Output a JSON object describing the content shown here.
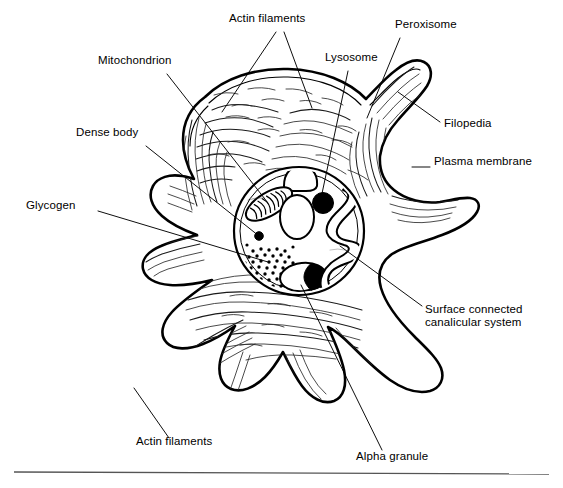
{
  "figure": {
    "background_color": "#ffffff",
    "ink_color": "#000000",
    "width": 563,
    "height": 488,
    "has_bottom_rule": true,
    "bottom_rule_color": "#555555"
  },
  "labels": {
    "actin_filaments_top": "Actin filaments",
    "peroxisome": "Peroxisome",
    "mitochondrion": "Mitochondrion",
    "lysosome": "Lysosome",
    "filopedia": "Filopedia",
    "dense_body": "Dense body",
    "plasma_membrane": "Plasma membrane",
    "glycogen": "Glycogen",
    "surface_connected_canalicular_system": "Surface connected\ncanalicular system",
    "actin_filaments_bottom": "Actin filaments",
    "alpha_granule": "Alpha granule"
  },
  "annotations": [
    {
      "id": "actin-filaments-top",
      "label": "Actin filaments",
      "text_x": 229,
      "text_y": 18,
      "lines": 1,
      "leaders": [
        {
          "x1": 276,
          "y1": 32,
          "x2": 222,
          "y2": 112
        },
        {
          "x1": 284,
          "y1": 32,
          "x2": 312,
          "y2": 108
        }
      ]
    },
    {
      "id": "peroxisome",
      "label": "Peroxisome",
      "text_x": 395,
      "text_y": 24,
      "lines": 1,
      "leaders": [
        {
          "x1": 400,
          "y1": 38,
          "x2": 367,
          "y2": 118
        }
      ]
    },
    {
      "id": "mitochondrion",
      "label": "Mitochondrion",
      "text_x": 98,
      "text_y": 60,
      "lines": 1,
      "leaders": [
        {
          "x1": 167,
          "y1": 74,
          "x2": 268,
          "y2": 203
        }
      ]
    },
    {
      "id": "lysosome",
      "label": "Lysosome",
      "text_x": 325,
      "text_y": 57,
      "lines": 1,
      "leaders": [
        {
          "x1": 348,
          "y1": 71,
          "x2": 320,
          "y2": 203
        }
      ]
    },
    {
      "id": "filopedia",
      "label": "Filopedia",
      "text_x": 444,
      "text_y": 122,
      "lines": 1,
      "leaders": [
        {
          "x1": 440,
          "y1": 122,
          "x2": 398,
          "y2": 92
        }
      ]
    },
    {
      "id": "dense-body",
      "label": "Dense body",
      "text_x": 76,
      "text_y": 132,
      "lines": 1,
      "leaders": [
        {
          "x1": 146,
          "y1": 146,
          "x2": 259,
          "y2": 236
        }
      ]
    },
    {
      "id": "plasma-membrane",
      "label": "Plasma membrane",
      "text_x": 434,
      "text_y": 161,
      "lines": 1,
      "leaders": [
        {
          "x1": 430,
          "y1": 167,
          "x2": 412,
          "y2": 167
        }
      ]
    },
    {
      "id": "glycogen",
      "label": "Glycogen",
      "text_x": 26,
      "text_y": 205,
      "lines": 1,
      "leaders": [
        {
          "x1": 98,
          "y1": 211,
          "x2": 268,
          "y2": 262
        }
      ]
    },
    {
      "id": "surface-connected-canalicular-system",
      "label": "Surface connected\ncanalicular system",
      "text_x": 425,
      "text_y": 308,
      "lines": 2,
      "leaders": [
        {
          "x1": 422,
          "y1": 306,
          "x2": 340,
          "y2": 246
        }
      ]
    },
    {
      "id": "actin-filaments-bottom",
      "label": "Actin filaments",
      "text_x": 136,
      "text_y": 441,
      "lines": 1,
      "leaders": [
        {
          "x1": 169,
          "y1": 438,
          "x2": 134,
          "y2": 388
        }
      ]
    },
    {
      "id": "alpha-granule",
      "label": "Alpha granule",
      "text_x": 356,
      "text_y": 456,
      "lines": 1,
      "leaders": [
        {
          "x1": 382,
          "y1": 450,
          "x2": 301,
          "y2": 285
        }
      ]
    }
  ],
  "structures": {
    "plasma_membrane": {
      "name": "plasma-membrane",
      "stroke_width": 2.6
    },
    "granulomere": {
      "name": "granulomere-boundary",
      "cx": 299,
      "cy": 231,
      "rx": 65,
      "ry": 64
    },
    "mitochondrion": {
      "name": "mitochondrion",
      "cx": 269,
      "cy": 204,
      "cristae_count": 9
    },
    "lysosome": {
      "name": "lysosome",
      "cx": 322,
      "cy": 204,
      "r": 10.5,
      "fill": "#000000"
    },
    "peroxisome": {
      "name": "peroxisome",
      "cx": 297,
      "cy": 178,
      "shape": "dome"
    },
    "dense_body": {
      "name": "dense-body",
      "cx": 259,
      "cy": 236,
      "r": 4.2,
      "fill": "#000000"
    },
    "glycogen": {
      "name": "glycogen-granules",
      "cx": 272,
      "cy": 267,
      "dot_count": 96,
      "dot_r": 1.7
    },
    "alpha_granule": {
      "name": "alpha-granule",
      "cx": 303,
      "cy": 277,
      "has_dark_nucleoid": true
    },
    "open_canalicular_system": {
      "name": "surface-connected-canalicular-system",
      "cx": 337,
      "cy": 242
    },
    "central_vacuole": {
      "name": "central-vacuole",
      "cx": 297,
      "cy": 215
    },
    "filopodia_count": 7
  }
}
